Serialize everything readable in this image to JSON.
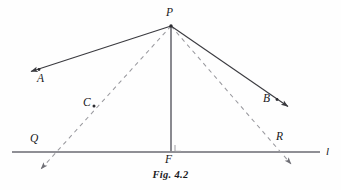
{
  "figure": {
    "caption": "Fig. 4.2",
    "colors": {
      "solid_stroke": "#3a3a3f",
      "dashed_stroke": "#9a9a9f",
      "baseline_stroke": "#8f8f95",
      "vertical_stroke": "#8a8a90",
      "label_color": "#17171a"
    },
    "labels": {
      "apex": "P",
      "ray_a": "A",
      "ray_b": "B",
      "point_c": "C",
      "foot": "F",
      "left_intersection": "Q",
      "right_intersection": "R",
      "line": "l"
    },
    "geometry": {
      "apex": {
        "x": 171,
        "y": 26
      },
      "foot": {
        "x": 171,
        "y": 152
      },
      "baseline": {
        "x1": 12,
        "y1": 152,
        "x2": 320,
        "y2": 152
      },
      "ray_pa": {
        "x1": 171,
        "y1": 26,
        "x2": 30,
        "y2": 72
      },
      "ray_pb": {
        "x1": 171,
        "y1": 26,
        "x2": 287,
        "y2": 106
      },
      "dashed_left": {
        "x1": 171,
        "y1": 26,
        "x2": 41,
        "y2": 169
      },
      "dashed_right": {
        "x1": 171,
        "y1": 26,
        "x2": 291,
        "y2": 164
      },
      "point_c_marker": {
        "x": 94,
        "y": 106
      },
      "left_intersection_point": {
        "x": 45,
        "y": 152
      },
      "right_intersection_point": {
        "x": 279,
        "y": 152
      },
      "right_angle_mark": {
        "x": 175,
        "y": 143,
        "size": 7
      }
    },
    "label_positions": {
      "apex": {
        "x": 166,
        "y": 8
      },
      "ray_a": {
        "x": 38,
        "y": 75
      },
      "ray_b": {
        "x": 264,
        "y": 94
      },
      "point_c": {
        "x": 83,
        "y": 98
      },
      "foot": {
        "x": 166,
        "y": 155
      },
      "left_intersection": {
        "x": 31,
        "y": 134
      },
      "right_intersection": {
        "x": 277,
        "y": 132
      },
      "line": {
        "x": 325,
        "y": 147
      }
    }
  }
}
